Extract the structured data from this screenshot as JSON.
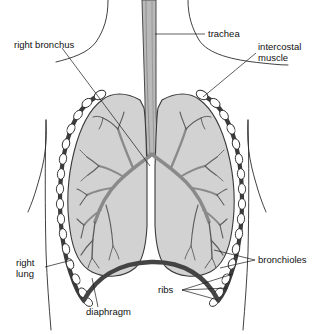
{
  "figure": {
    "background_color": "#ffffff"
  },
  "colors": {
    "lung_fill": "#d2d2d2",
    "lung_stroke": "#3a3a3a",
    "trachea_fill": "#b8b8b8",
    "bronchi_stroke": "#8a8a8a",
    "bronchiole_stroke": "#5e5e5e",
    "rib_band": "#3b3b3b",
    "rib_oval_fill": "#ffffff",
    "diaphragm": "#444444",
    "outline": "#2b2b2b",
    "leader_line": "#1a1a1a",
    "text": "#111111"
  },
  "labels": [
    {
      "id": "right-bronchus",
      "text": "right bronchus",
      "lines": [
        "right bronchus"
      ],
      "x": 14,
      "y": 45,
      "anchor": "start"
    },
    {
      "id": "trachea",
      "text": "trachea",
      "lines": [
        "trachea"
      ],
      "x": 208,
      "y": 34,
      "anchor": "start"
    },
    {
      "id": "intercostal-muscle",
      "text": "intercostal muscle",
      "lines": [
        "intercostal",
        "muscle"
      ],
      "x": 258,
      "y": 51,
      "anchor": "start"
    },
    {
      "id": "bronchioles",
      "text": "bronchioles",
      "lines": [
        "bronchioles"
      ],
      "x": 258,
      "y": 260,
      "anchor": "start"
    },
    {
      "id": "ribs",
      "text": "ribs",
      "lines": [
        "ribs"
      ],
      "x": 158,
      "y": 290,
      "anchor": "start"
    },
    {
      "id": "right-lung",
      "text": "right lung",
      "lines": [
        "right",
        "lung"
      ],
      "x": 16,
      "y": 265,
      "anchor": "start"
    },
    {
      "id": "diaphragm",
      "text": "diaphragm",
      "lines": [
        "diaphragm"
      ],
      "x": 86,
      "y": 312,
      "anchor": "start"
    }
  ],
  "structures": [
    {
      "id": "trachea",
      "name": "trachea"
    },
    {
      "id": "left-lung",
      "name": "lung (viewer left)"
    },
    {
      "id": "right-lung",
      "name": "lung (viewer right)"
    },
    {
      "id": "bronchial-tree",
      "name": "bronchial tree"
    },
    {
      "id": "ribcage-left",
      "name": "ribcage left"
    },
    {
      "id": "ribcage-right",
      "name": "ribcage right"
    },
    {
      "id": "diaphragm",
      "name": "diaphragm"
    },
    {
      "id": "body-outline",
      "name": "body outline"
    }
  ]
}
